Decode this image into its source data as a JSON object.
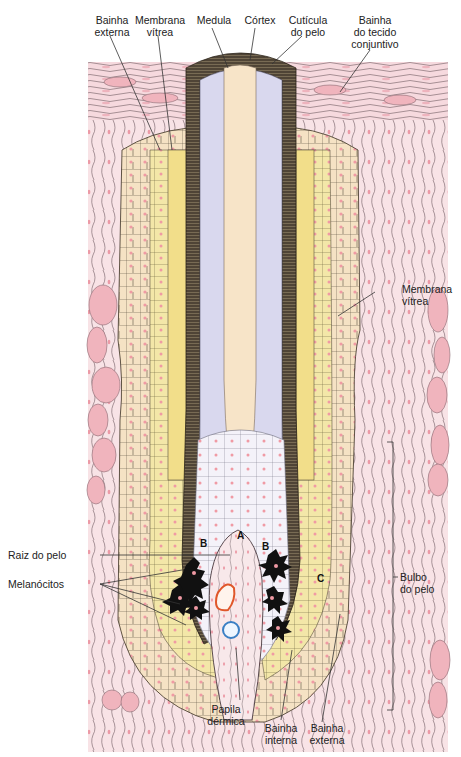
{
  "diagram": {
    "language": "pt",
    "colors": {
      "background": "#ffffff",
      "dermis": "#f6d9de",
      "dermis_cells": "#efb9c2",
      "fibers": "#6e5a62",
      "outer_sheath": "#f5e2c4",
      "inner_sheath": "#f2e39a",
      "vitreous": "#f8f2cf",
      "cuticle": "#4f4436",
      "cortex": "#d9d8ee",
      "medulla": "#f7e4c8",
      "bulb_matrix": "#f1f0f8",
      "melanocytes": "#111111",
      "nuclei": "#f09aa4",
      "artery": "#e0572a",
      "vein": "#3a7fc4",
      "leader_line": "#333333"
    },
    "labels": {
      "top": [
        {
          "id": "bainha-externa-top",
          "text": "Bainha\nexterna"
        },
        {
          "id": "membrana-vitrea-top",
          "text": "Membrana\nvítrea"
        },
        {
          "id": "medula",
          "text": "Medula"
        },
        {
          "id": "cortex",
          "text": "Córtex"
        },
        {
          "id": "cuticula",
          "text": "Cutícula\ndo pelo"
        },
        {
          "id": "bainha-tecido",
          "text": "Bainha\ndo tecido\nconjuntivo"
        }
      ],
      "right": [
        {
          "id": "membrana-vitrea-right",
          "text": "Membrana\nvítrea"
        },
        {
          "id": "bulbo",
          "text": "Bulbo\ndo pelo"
        }
      ],
      "left": [
        {
          "id": "raiz",
          "text": "Raiz do pelo"
        },
        {
          "id": "melanocitos",
          "text": "Melanócitos"
        }
      ],
      "bottom": [
        {
          "id": "papila",
          "text": "Papila\ndérmica"
        },
        {
          "id": "bainha-interna",
          "text": "Bainha\ninterna"
        },
        {
          "id": "bainha-externa-bottom",
          "text": "Bainha\nexterna"
        }
      ],
      "letters": {
        "a": "A",
        "b_left": "B",
        "b_right": "B",
        "c": "C"
      }
    }
  }
}
